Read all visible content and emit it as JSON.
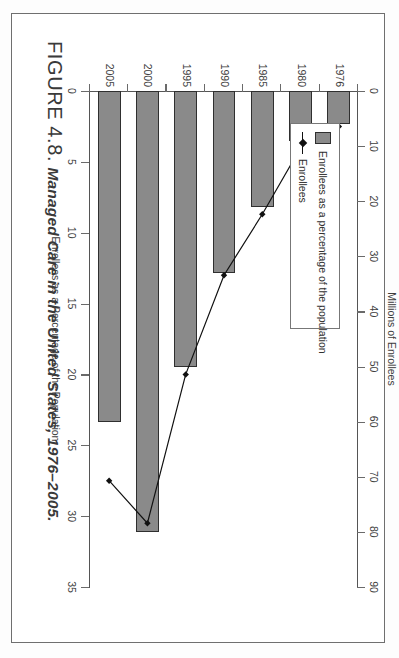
{
  "figure": {
    "number": "FIGURE 4.8.",
    "caption": "Managed Care in the United States, 1976–2005."
  },
  "legend": {
    "items": [
      {
        "label": "Enrollees as a percentage of the population",
        "marker": "filled-rectangle-swatch",
        "color": "#8a8a8a"
      },
      {
        "label": "Enrollees",
        "marker": "line-with-diamond",
        "color": "#111111"
      }
    ]
  },
  "chart_data": {
    "type": "bar",
    "title": "Managed Care in the United States, 1976–2005.",
    "orientation": "horizontal",
    "categories": [
      "1976",
      "1980",
      "1985",
      "1990",
      "1995",
      "2000",
      "2005"
    ],
    "xlabel": "",
    "ylabel": "",
    "grid": false,
    "legend_position": "top-left-inside",
    "series": [
      {
        "name": "Enrollees",
        "type": "bar",
        "axis": "top",
        "unit": "Millions of Enrollees",
        "axis_title": "Millions of Enrollees",
        "ticks": [
          0,
          10,
          20,
          30,
          40,
          50,
          60,
          70,
          80,
          90
        ],
        "lim": [
          0,
          90
        ],
        "values": [
          6,
          9,
          21,
          33,
          50,
          80,
          60
        ],
        "color": "#8a8a8a"
      },
      {
        "name": "Enrollees as a percentage of the population",
        "type": "line",
        "axis": "bottom",
        "unit": "Percent",
        "axis_title": "Enrollees as a Percentage of the Population",
        "ticks": [
          0,
          5,
          10,
          15,
          20,
          25,
          30,
          35
        ],
        "lim": [
          0,
          35
        ],
        "values": [
          2.5,
          4.0,
          8.7,
          13.0,
          20.0,
          30.5,
          27.5
        ],
        "color": "#111111"
      }
    ]
  }
}
